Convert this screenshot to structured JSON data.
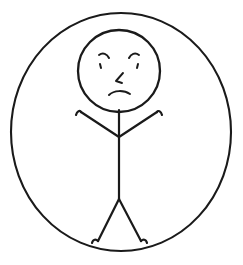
{
  "artwork": {
    "title": "Angry Stick Figure In Circle",
    "style": "hand-drawn line art",
    "background_color": "#ffffff",
    "ink_color": "#1a1a1a",
    "canvas": {
      "width": 243,
      "height": 265
    },
    "subject": "stick figure person with angry facial expression enclosed by a large circle"
  },
  "shapes": {
    "enclosure": {
      "name": "outer-circle",
      "label": "Enclosing Circle",
      "center_x": 121,
      "center_y": 132,
      "radius_x": 110,
      "radius_y": 119,
      "stroke_width": 2.1
    },
    "head": {
      "name": "head-circle",
      "label": "Head",
      "center_x": 119,
      "center_y": 71,
      "radius_x": 41,
      "radius_y": 41,
      "stroke_width": 2.3
    },
    "torso": {
      "name": "torso-line",
      "label": "Torso",
      "x1": 119,
      "y1": 110,
      "x2": 119,
      "y2": 199,
      "stroke_width": 2.2
    },
    "arm_left": {
      "name": "left-arm",
      "label": "Left Arm",
      "path": "M 81 112 L 119 137",
      "hand_path": "M 76 115 C 77 111 80 110 81 112"
    },
    "arm_right": {
      "name": "right-arm",
      "label": "Right Arm",
      "path": "M 157 112 L 119 137",
      "hand_path": "M 162 115 C 161 111 158 110 157 112"
    },
    "leg_left": {
      "name": "left-leg",
      "label": "Left Leg",
      "path": "M 119 199 L 98 241",
      "foot_path": "M 92 243 C 93 239 96 239 98 241"
    },
    "leg_right": {
      "name": "right-leg",
      "label": "Right Leg",
      "path": "M 119 199 L 141 241",
      "foot_path": "M 147 243 C 146 239 143 239 141 241"
    }
  },
  "face": {
    "expression": "angry",
    "eyebrow_left": {
      "name": "left-eyebrow",
      "label": "Left Eyebrow",
      "path": "M 99 55 C 103 52 107 54 109 58"
    },
    "eyebrow_right": {
      "name": "right-eyebrow",
      "label": "Right Eyebrow",
      "path": "M 139 55 C 135 52 131 54 129 58"
    },
    "eye_left": {
      "name": "left-eye",
      "label": "Left Eye",
      "path": "M 100 64 L 101 68"
    },
    "eye_right": {
      "name": "right-eye",
      "label": "Right Eye",
      "path": "M 138 64 L 137 68"
    },
    "nose": {
      "name": "nose",
      "label": "Nose",
      "path": "M 123 73 L 116 81 L 122 83"
    },
    "mouth": {
      "name": "mouth-frown",
      "label": "Frowning Mouth",
      "path": "M 109 95 C 114 90 124 90 130 94"
    }
  }
}
